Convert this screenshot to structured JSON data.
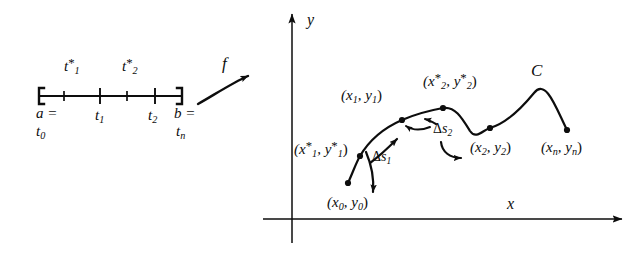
{
  "figure": {
    "background_color": "#ffffff",
    "ink_color": "#0d0d0d"
  },
  "interval": {
    "left_bracket": "[",
    "right_bracket": "]",
    "endpoint_left_top": "a =",
    "endpoint_left_bottom": "t",
    "endpoint_left_bottom_sub": "0",
    "endpoint_right_top": "b =",
    "endpoint_right_bottom": "t",
    "endpoint_right_bottom_sub": "n",
    "sample_points": [
      {
        "base": "t",
        "sub": "1",
        "star": "*"
      },
      {
        "base": "t",
        "sub": "2",
        "star": "*"
      }
    ],
    "partition_points": [
      {
        "base": "t",
        "sub": "1"
      },
      {
        "base": "t",
        "sub": "2"
      }
    ]
  },
  "map_arrow": {
    "label": "f"
  },
  "axes": {
    "y_label": "y",
    "x_label": "x"
  },
  "curve": {
    "name": "C",
    "points": [
      {
        "label": "(x",
        "sub1": "0",
        "mid": ", y",
        "sub2": "0",
        "close": ")",
        "star": ""
      },
      {
        "label": "(x",
        "sub1": "1",
        "mid": ", y",
        "sub2": "1",
        "close": ")",
        "star": "*"
      },
      {
        "label": "(x",
        "sub1": "1",
        "mid": ", y",
        "sub2": "1",
        "close": ")",
        "star": ""
      },
      {
        "label": "(x",
        "sub1": "2",
        "mid": ", y",
        "sub2": "2",
        "close": ")",
        "star": "*"
      },
      {
        "label": "(x",
        "sub1": "2",
        "mid": ", y",
        "sub2": "2",
        "close": ")",
        "star": ""
      },
      {
        "label": "(x",
        "sub1": "n",
        "mid": ", y",
        "sub2": "n",
        "close": ")",
        "star": ""
      }
    ],
    "arc_lengths": [
      {
        "delta": "Δ",
        "base": "s",
        "sub": "1"
      },
      {
        "delta": "Δ",
        "base": "s",
        "sub": "2"
      }
    ]
  },
  "text": {
    "t_star_1_base": "t",
    "t_star_1_sub": "1",
    "t_star_1_star": "*",
    "t_star_2_base": "t",
    "t_star_2_sub": "2",
    "t_star_2_star": "*",
    "t_1_base": "t",
    "t_1_sub": "1",
    "t_2_base": "t",
    "t_2_sub": "2",
    "a_eq": "a =",
    "t_0_base": "t",
    "t_0_sub": "0",
    "b_eq": "b =",
    "t_n_base": "t",
    "t_n_sub": "n",
    "f": "f",
    "y": "y",
    "x": "x",
    "C": "C",
    "p0_open": "(x",
    "p0_s1": "0",
    "p0_mid": ", y",
    "p0_s2": "0",
    "p0_close": ")",
    "p1s_open": "(x",
    "p1s_s1": "1",
    "p1s_star": "*",
    "p1s_mid": ", y",
    "p1s_s2": "1",
    "p1s_star2": "*",
    "p1s_close": ")",
    "p1_open": "(x",
    "p1_s1": "1",
    "p1_mid": ", y",
    "p1_s2": "1",
    "p1_close": ")",
    "p2s_open": "(x",
    "p2s_s1": "2",
    "p2s_star": "*",
    "p2s_mid": ", y",
    "p2s_s2": "2",
    "p2s_star2": "*",
    "p2s_close": ")",
    "p2_open": "(x",
    "p2_s1": "2",
    "p2_mid": ", y",
    "p2_s2": "2",
    "p2_close": ")",
    "pn_open": "(x",
    "pn_s1": "n",
    "pn_mid": ", y",
    "pn_s2": "n",
    "pn_close": ")",
    "ds1_delta": "Δ",
    "ds1_base": "s",
    "ds1_sub": "1",
    "ds2_delta": "Δ",
    "ds2_base": "s",
    "ds2_sub": "2"
  }
}
